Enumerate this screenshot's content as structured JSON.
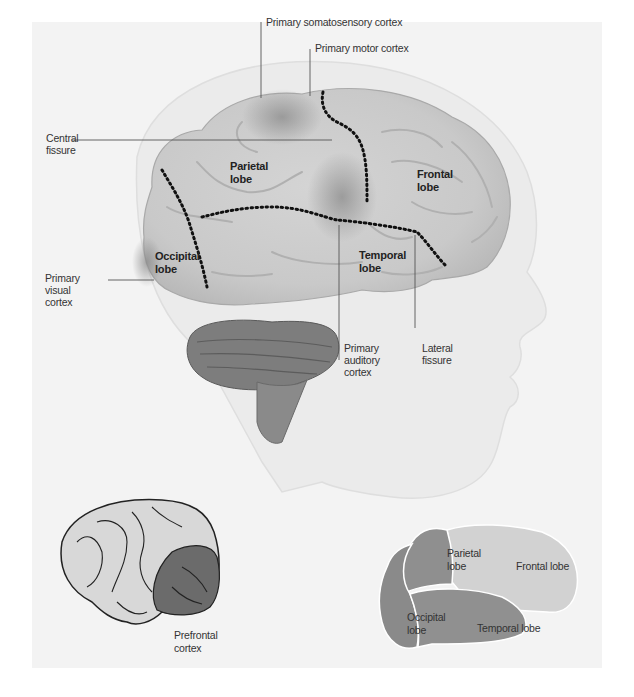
{
  "figure": {
    "main_diagram": {
      "callouts": {
        "somatosensory": "Primary somatosensory cortex",
        "motor": "Primary motor cortex",
        "central_fissure": "Central\nfissure",
        "visual_cortex": "Primary\nvisual\ncortex",
        "auditory_cortex": "Primary\nauditory\ncortex",
        "lateral_fissure": "Lateral\nfissure"
      },
      "lobes": {
        "parietal": "Parietal\nlobe",
        "frontal": "Frontal\nlobe",
        "occipital": "Occipital\nlobe",
        "temporal": "Temporal\nlobe"
      }
    },
    "inset_prefrontal": {
      "label": "Prefrontal\ncortex"
    },
    "inset_lobes": {
      "parietal": "Parietal\nlobe",
      "frontal": "Frontal lobe",
      "occipital": "Occipital\nlobe",
      "temporal": "Temporal lobe"
    },
    "colors": {
      "background": "#f3f3f3",
      "brain_light": "#d6d6d6",
      "brain_shadow": "#a8a8a8",
      "cerebellum": "#7a7a7a",
      "prefrontal": "#6b6b6b",
      "inset_frontal": "#d0d0d0",
      "inset_other_lobes": "#8f8f8f",
      "fissure_dots": "#111111"
    }
  }
}
